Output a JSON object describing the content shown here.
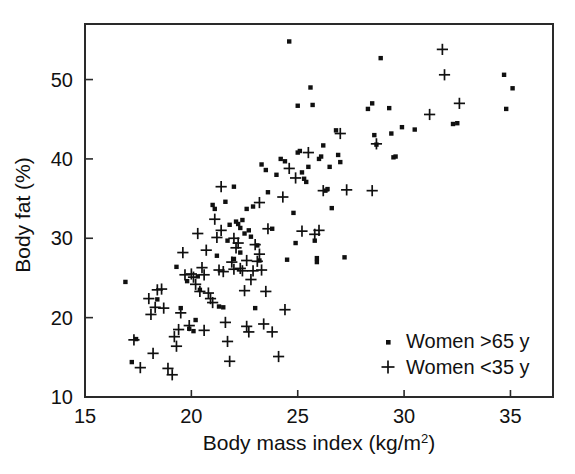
{
  "figure": {
    "background_color": "#ffffff",
    "marker_color": "#101010",
    "axis_color": "#2a2a2a"
  },
  "chart_data": {
    "type": "scatter",
    "title": "",
    "xlabel": "Body mass index (kg/m2)",
    "xlabel_base": "Body mass index (kg/m",
    "xlabel_sup": "2",
    "xlabel_tail": ")",
    "ylabel": "Body fat (%)",
    "xlim": [
      15,
      37
    ],
    "ylim": [
      10,
      57
    ],
    "xticks": [
      15,
      20,
      25,
      30,
      35
    ],
    "xtick_labels": [
      "15",
      "20",
      "25",
      "30",
      "35"
    ],
    "yticks": [
      10,
      20,
      30,
      40,
      50
    ],
    "ytick_labels": [
      "10",
      "20",
      "30",
      "40",
      "50"
    ],
    "grid": false,
    "legend_position": "lower right",
    "series": [
      {
        "name": "Women >65 y",
        "marker": "square",
        "legend_label": "Women >65 y",
        "points": [
          [
            16.9,
            24.5
          ],
          [
            17.4,
            17.3
          ],
          [
            17.2,
            14.4
          ],
          [
            18.4,
            22.3
          ],
          [
            19.3,
            26.4
          ],
          [
            19.8,
            24.6
          ],
          [
            19.5,
            21.2
          ],
          [
            19.9,
            18.6
          ],
          [
            20.3,
            25.2
          ],
          [
            20.4,
            23.5
          ],
          [
            20.1,
            18.3
          ],
          [
            21.0,
            34.2
          ],
          [
            21.1,
            33.7
          ],
          [
            21.2,
            27.8
          ],
          [
            21.3,
            21.4
          ],
          [
            21.5,
            21.3
          ],
          [
            21.6,
            34.6
          ],
          [
            21.7,
            29.7
          ],
          [
            21.8,
            31.7
          ],
          [
            22.0,
            36.5
          ],
          [
            22.1,
            32.1
          ],
          [
            22.2,
            31.8
          ],
          [
            22.3,
            31.3
          ],
          [
            22.4,
            32.3
          ],
          [
            22.5,
            30.6
          ],
          [
            22.3,
            28.2
          ],
          [
            22.6,
            33.7
          ],
          [
            22.7,
            31.0
          ],
          [
            22.8,
            30.2
          ],
          [
            22.9,
            34.0
          ],
          [
            23.0,
            21.2
          ],
          [
            23.1,
            29.1
          ],
          [
            23.3,
            39.3
          ],
          [
            23.5,
            38.6
          ],
          [
            23.6,
            35.8
          ],
          [
            23.8,
            31.2
          ],
          [
            24.0,
            38.0
          ],
          [
            24.2,
            40.0
          ],
          [
            24.4,
            39.7
          ],
          [
            24.6,
            54.8
          ],
          [
            24.5,
            27.3
          ],
          [
            24.8,
            33.2
          ],
          [
            24.9,
            29.4
          ],
          [
            25.0,
            40.8
          ],
          [
            25.1,
            41.0
          ],
          [
            25.2,
            38.3
          ],
          [
            25.3,
            37.5
          ],
          [
            25.4,
            37.1
          ],
          [
            25.5,
            39.0
          ],
          [
            25.6,
            49.0
          ],
          [
            25.0,
            46.7
          ],
          [
            25.7,
            46.8
          ],
          [
            25.8,
            29.7
          ],
          [
            25.9,
            27.0
          ],
          [
            25.9,
            27.5
          ],
          [
            26.0,
            40.0
          ],
          [
            26.1,
            40.3
          ],
          [
            26.2,
            41.7
          ],
          [
            26.3,
            36.0
          ],
          [
            26.4,
            36.2
          ],
          [
            26.5,
            39.0
          ],
          [
            26.6,
            33.8
          ],
          [
            26.8,
            43.6
          ],
          [
            26.9,
            40.5
          ],
          [
            27.0,
            39.6
          ],
          [
            27.2,
            27.6
          ],
          [
            28.3,
            46.3
          ],
          [
            28.5,
            47.0
          ],
          [
            28.6,
            43.0
          ],
          [
            28.7,
            41.8
          ],
          [
            28.9,
            52.7
          ],
          [
            29.3,
            46.4
          ],
          [
            29.4,
            43.2
          ],
          [
            29.5,
            40.2
          ],
          [
            29.6,
            40.3
          ],
          [
            29.9,
            44.0
          ],
          [
            30.5,
            43.7
          ],
          [
            32.3,
            44.4
          ],
          [
            32.5,
            44.5
          ],
          [
            34.7,
            50.6
          ],
          [
            34.8,
            46.3
          ],
          [
            35.1,
            48.9
          ],
          [
            23.2,
            27.2
          ],
          [
            22.0,
            27.4
          ],
          [
            20.2,
            19.7
          ]
        ]
      },
      {
        "name": "Women <35 y",
        "marker": "plus",
        "legend_label": "Women <35 y",
        "points": [
          [
            17.3,
            17.2
          ],
          [
            17.6,
            13.7
          ],
          [
            18.0,
            22.4
          ],
          [
            18.1,
            20.4
          ],
          [
            18.2,
            15.5
          ],
          [
            18.3,
            21.3
          ],
          [
            18.4,
            23.5
          ],
          [
            18.6,
            23.6
          ],
          [
            18.7,
            21.2
          ],
          [
            18.9,
            13.6
          ],
          [
            19.1,
            12.8
          ],
          [
            19.2,
            17.6
          ],
          [
            19.3,
            16.4
          ],
          [
            19.4,
            18.5
          ],
          [
            19.5,
            20.6
          ],
          [
            19.6,
            28.2
          ],
          [
            19.9,
            19.0
          ],
          [
            20.0,
            25.5
          ],
          [
            20.1,
            25.1
          ],
          [
            20.2,
            24.2
          ],
          [
            20.3,
            30.6
          ],
          [
            20.4,
            23.3
          ],
          [
            20.5,
            26.3
          ],
          [
            20.6,
            25.4
          ],
          [
            20.7,
            28.5
          ],
          [
            20.8,
            23.1
          ],
          [
            20.9,
            22.4
          ],
          [
            21.0,
            21.9
          ],
          [
            21.1,
            32.4
          ],
          [
            21.2,
            30.1
          ],
          [
            21.3,
            26.0
          ],
          [
            21.4,
            36.5
          ],
          [
            21.5,
            25.8
          ],
          [
            21.6,
            19.4
          ],
          [
            21.7,
            17.0
          ],
          [
            21.8,
            14.5
          ],
          [
            21.9,
            27.0
          ],
          [
            22.0,
            30.0
          ],
          [
            22.1,
            28.8
          ],
          [
            22.2,
            29.4
          ],
          [
            22.3,
            26.2
          ],
          [
            22.4,
            25.9
          ],
          [
            22.5,
            23.4
          ],
          [
            22.6,
            18.9
          ],
          [
            22.7,
            18.2
          ],
          [
            22.8,
            24.8
          ],
          [
            22.9,
            25.9
          ],
          [
            23.0,
            29.2
          ],
          [
            23.1,
            27.1
          ],
          [
            23.2,
            34.5
          ],
          [
            23.3,
            26.0
          ],
          [
            23.4,
            19.2
          ],
          [
            23.5,
            23.3
          ],
          [
            23.6,
            31.2
          ],
          [
            23.8,
            18.2
          ],
          [
            24.1,
            15.1
          ],
          [
            24.3,
            35.2
          ],
          [
            24.4,
            21.0
          ],
          [
            24.6,
            38.8
          ],
          [
            24.9,
            37.6
          ],
          [
            25.2,
            30.9
          ],
          [
            25.5,
            40.8
          ],
          [
            25.8,
            30.5
          ],
          [
            26.0,
            31.0
          ],
          [
            26.2,
            36.0
          ],
          [
            27.0,
            43.2
          ],
          [
            27.3,
            36.1
          ],
          [
            28.5,
            36.0
          ],
          [
            28.7,
            41.9
          ],
          [
            31.2,
            45.6
          ],
          [
            31.8,
            53.8
          ],
          [
            31.9,
            50.6
          ],
          [
            32.6,
            47.0
          ],
          [
            21.4,
            31.0
          ],
          [
            22.0,
            26.1
          ],
          [
            22.6,
            27.2
          ],
          [
            19.7,
            25.4
          ],
          [
            20.6,
            18.4
          ],
          [
            23.2,
            28.0
          ]
        ]
      }
    ]
  }
}
